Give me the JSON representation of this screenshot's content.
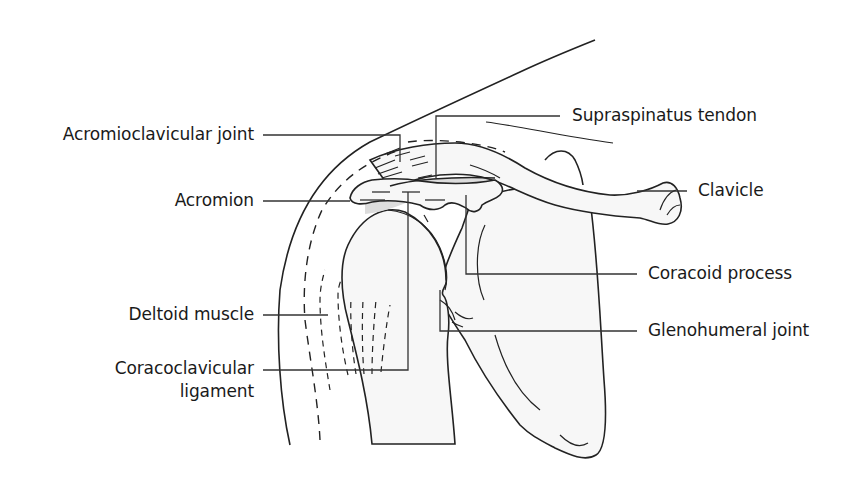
{
  "diagram": {
    "labels": {
      "acromioclavicular_joint": "Acromioclavicular joint",
      "acromion": "Acromion",
      "deltoid_muscle": "Deltoid muscle",
      "coracoclavicular_ligament_line1": "Coracoclavicular",
      "coracoclavicular_ligament_line2": "ligament",
      "supraspinatus_tendon": "Supraspinatus tendon",
      "clavicle": "Clavicle",
      "coracoid_process": "Coracoid process",
      "glenohumeral_joint": "Glenohumeral joint"
    },
    "colors": {
      "line": "#222222",
      "bone_fill": "#f7f7f7",
      "shaded_region": "#dcdcdc",
      "background": "#ffffff"
    }
  }
}
